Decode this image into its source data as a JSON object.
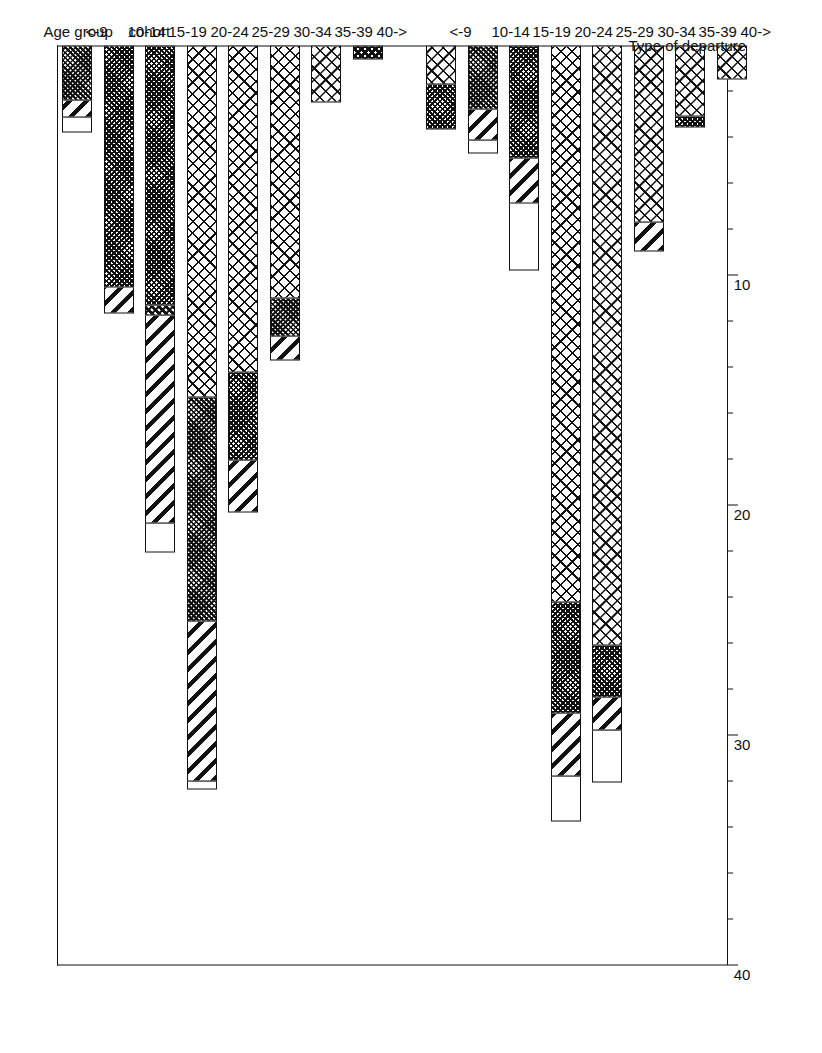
{
  "chart_data": {
    "type": "bar",
    "orientation": "horizontal-rotated",
    "title": "",
    "xlabel": "Age group cohort",
    "ylabel": "",
    "axis_label_top": "Age group",
    "axis_label_top2": "cohort",
    "ylim": [
      0,
      40
    ],
    "ticks_major": [
      0,
      10,
      20,
      30,
      40
    ],
    "tick_labels": [
      "0",
      "10",
      "20",
      "30",
      "40"
    ],
    "minor_tick_step": 2,
    "grid": false,
    "legend_title": "Type of departure",
    "legend_position": "bottom-right",
    "categories": [
      "<-9",
      "10-14",
      "15-19",
      "20-24",
      "25-29",
      "30-34",
      "35-39",
      "40->"
    ],
    "cohorts": [
      {
        "label": "1849-1890"
      },
      {
        "label": "1880-1920"
      }
    ],
    "series": [
      {
        "name": "marriage",
        "key": "marriage",
        "pattern": "cross-hatch-large"
      },
      {
        "name": "migration",
        "key": "migration",
        "pattern": "fine-checker"
      },
      {
        "name": "to kin",
        "key": "to_kin",
        "pattern": "medium-checker"
      },
      {
        "name": "to others",
        "key": "to_others",
        "pattern": "diagonal-stripe"
      },
      {
        "name": "unknown",
        "key": "unknown",
        "pattern": "solid-white"
      }
    ],
    "data": [
      {
        "cohort": "1849-1890",
        "age_group": "<-9",
        "marriage": 1.7,
        "migration": 2.0,
        "to_kin": 0.0,
        "to_others": 0.0,
        "unknown": 0.0,
        "total": 3.7
      },
      {
        "cohort": "1849-1890",
        "age_group": "10-14",
        "marriage": 0.0,
        "migration": 2.8,
        "to_kin": 0.0,
        "to_others": 1.4,
        "unknown": 0.6,
        "total": 4.8
      },
      {
        "cohort": "1849-1890",
        "age_group": "15-19",
        "marriage": 0.0,
        "migration": 4.9,
        "to_kin": 0.0,
        "to_others": 2.0,
        "unknown": 3.0,
        "total": 9.9
      },
      {
        "cohort": "1849-1890",
        "age_group": "20-24",
        "marriage": 24.2,
        "migration": 4.9,
        "to_kin": 0.0,
        "to_others": 2.8,
        "unknown": 2.0,
        "total": 33.9
      },
      {
        "cohort": "1849-1890",
        "age_group": "25-29",
        "marriage": 26.1,
        "migration": 2.3,
        "to_kin": 0.0,
        "to_others": 1.5,
        "unknown": 2.3,
        "total": 32.2
      },
      {
        "cohort": "1849-1890",
        "age_group": "30-34",
        "marriage": 7.7,
        "migration": 0.0,
        "to_kin": 0.0,
        "to_others": 1.3,
        "unknown": 0.0,
        "total": 9.0
      },
      {
        "cohort": "1849-1890",
        "age_group": "35-39",
        "marriage": 3.1,
        "migration": 0.5,
        "to_kin": 0.0,
        "to_others": 0.0,
        "unknown": 0.0,
        "total": 3.6
      },
      {
        "cohort": "1849-1890",
        "age_group": "40->",
        "marriage": 1.5,
        "migration": 0.0,
        "to_kin": 0.0,
        "to_others": 0.0,
        "unknown": 0.0,
        "total": 1.5
      },
      {
        "cohort": "1880-1920",
        "age_group": "<-9",
        "marriage": 0.0,
        "migration": 2.4,
        "to_kin": 0.0,
        "to_others": 0.8,
        "unknown": 0.7,
        "total": 3.9
      },
      {
        "cohort": "1880-1920",
        "age_group": "10-14",
        "marriage": 0.0,
        "migration": 10.5,
        "to_kin": 0.0,
        "to_others": 1.2,
        "unknown": 0.0,
        "total": 11.7
      },
      {
        "cohort": "1880-1920",
        "age_group": "15-19",
        "marriage": 0.0,
        "migration": 11.3,
        "to_kin": 0.5,
        "to_others": 9.1,
        "unknown": 1.3,
        "total": 22.2
      },
      {
        "cohort": "1880-1920",
        "age_group": "20-24",
        "marriage": 15.3,
        "migration": 9.8,
        "to_kin": 0.0,
        "to_others": 7.0,
        "unknown": 0.4,
        "total": 32.5
      },
      {
        "cohort": "1880-1920",
        "age_group": "25-29",
        "marriage": 14.2,
        "migration": 3.9,
        "to_kin": 0.0,
        "to_others": 2.3,
        "unknown": 0.0,
        "total": 20.4
      },
      {
        "cohort": "1880-1920",
        "age_group": "30-34",
        "marriage": 11.0,
        "migration": 1.7,
        "to_kin": 0.0,
        "to_others": 1.1,
        "unknown": 0.0,
        "total": 13.8
      },
      {
        "cohort": "1880-1920",
        "age_group": "35-39",
        "marriage": 2.5,
        "migration": 0.0,
        "to_kin": 0.0,
        "to_others": 0.0,
        "unknown": 0.0,
        "total": 2.5
      },
      {
        "cohort": "1880-1920",
        "age_group": "40->",
        "marriage": 0.0,
        "migration": 0.0,
        "to_kin": 0.6,
        "to_others": 0.0,
        "unknown": 0.0,
        "total": 0.6
      }
    ]
  },
  "axis": {
    "top_label_line1": "Age group",
    "top_label_line2": "cohort",
    "tick_0": "0",
    "tick_10": "10",
    "tick_20": "20",
    "tick_30": "30",
    "tick_40": "40"
  },
  "labels": {
    "a0": "<-9",
    "a1": "10-14",
    "a2": "15-19",
    "a3": "20-24",
    "a4": "25-29",
    "a5": "30-34",
    "a6": "35-39",
    "a7": "40->",
    "b0": "<-9",
    "b1": "10-14",
    "b2": "15-19",
    "b3": "20-24",
    "b4": "25-29",
    "b5": "30-34",
    "b6": "35-39",
    "b7": "40->",
    "cohort1": "1849-1890",
    "cohort2": "1880-1920"
  },
  "legend": {
    "title": "Type of departure",
    "items": [
      {
        "label": "marriage"
      },
      {
        "label": "migration"
      },
      {
        "label": "to kin"
      },
      {
        "label": "to others"
      },
      {
        "label": "unknown"
      }
    ]
  },
  "colors": {
    "ink": "#111111",
    "paper": "#ffffff"
  }
}
